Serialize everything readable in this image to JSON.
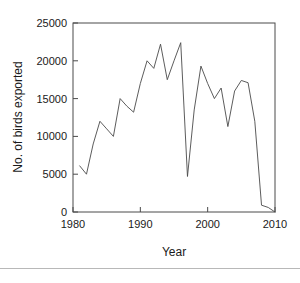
{
  "figure": {
    "name": "birds-exported-line-chart",
    "background_color": "#ffffff",
    "line_color": "#4a4a4a",
    "axis_color": "#4a4a4a"
  },
  "axes": {
    "xlabel": "Year",
    "ylabel": "No. of birds exported",
    "x_ticks": [
      "1980",
      "1990",
      "2000",
      "2010"
    ],
    "y_ticks": [
      "0",
      "5000",
      "10000",
      "15000",
      "20000",
      "25000"
    ]
  },
  "chart_data": {
    "type": "line",
    "title": "",
    "xlabel": "Year",
    "ylabel": "No. of birds exported",
    "xlim": [
      1980,
      2010
    ],
    "ylim": [
      0,
      25000
    ],
    "x_ticks": [
      1980,
      1990,
      2000,
      2010
    ],
    "y_ticks": [
      0,
      5000,
      10000,
      15000,
      20000,
      25000
    ],
    "grid": false,
    "legend": "none",
    "x": [
      1981,
      1982,
      1983,
      1984,
      1985,
      1986,
      1987,
      1988,
      1989,
      1990,
      1991,
      1992,
      1993,
      1994,
      1995,
      1996,
      1997,
      1998,
      1999,
      2000,
      2001,
      2002,
      2003,
      2004,
      2005,
      2006,
      2007,
      2008,
      2009,
      2010
    ],
    "values": [
      6100,
      5000,
      9000,
      12000,
      11000,
      10000,
      15000,
      14000,
      13200,
      17000,
      20000,
      19000,
      22200,
      17500,
      20000,
      22400,
      4700,
      13500,
      19300,
      17000,
      15000,
      16400,
      11300,
      16000,
      17400,
      17100,
      12000,
      900,
      600,
      0
    ],
    "series": [
      {
        "name": "No. of birds exported",
        "values": [
          6100,
          5000,
          9000,
          12000,
          11000,
          10000,
          15000,
          14000,
          13200,
          17000,
          20000,
          19000,
          22200,
          17500,
          20000,
          22400,
          4700,
          13500,
          19300,
          17000,
          15000,
          16400,
          11300,
          16000,
          17400,
          17100,
          12000,
          900,
          600,
          0
        ]
      }
    ]
  }
}
